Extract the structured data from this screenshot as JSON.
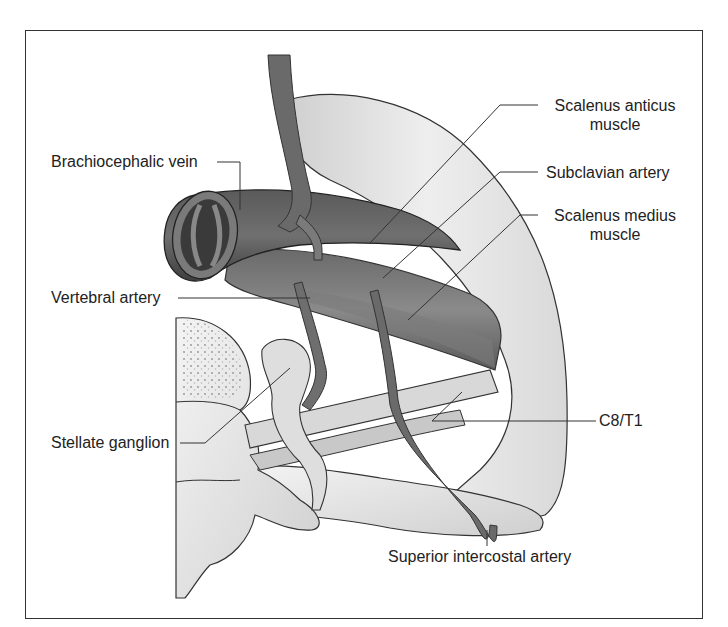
{
  "figure": {
    "type": "anatomical illustration",
    "colors": {
      "background": "#ffffff",
      "frame": "#333333",
      "vein_dark": "#4a4a4a",
      "artery_mid": "#6e6e6e",
      "muscle_light": "#e4e4e4",
      "leader_line": "#333333",
      "label_text": "#222222"
    }
  },
  "labels": {
    "brachiocephalic_vein": "Brachiocephalic vein",
    "scalenus_anticus_line1": "Scalenus anticus",
    "scalenus_anticus_line2": "muscle",
    "subclavian_artery": "Subclavian artery",
    "scalenus_medius_line1": "Scalenus medius",
    "scalenus_medius_line2": "muscle",
    "vertebral_artery": "Vertebral artery",
    "stellate_ganglion": "Stellate ganglion",
    "c8_t1": "C8/T1",
    "superior_intercostal_artery": "Superior intercostal artery"
  }
}
